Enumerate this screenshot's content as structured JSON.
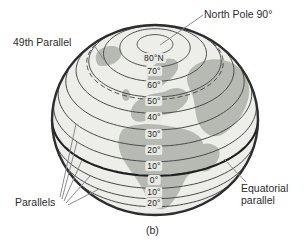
{
  "figure": {
    "caption": "(b)"
  },
  "colors": {
    "background": "#ffffff",
    "ocean": "#edeeea",
    "land": "#b7bab3",
    "outline": "#2e2e2e",
    "parallel": "#4a4a4a",
    "equator": "#1f1f1f",
    "leader": "#8a8a8a",
    "text": "#2b2b2b",
    "label_bg": "#e8e9e5"
  },
  "globe": {
    "center_x": 155,
    "center_y": 120,
    "radius_x": 103,
    "radius_y": 95,
    "view_latitude_deg": 36,
    "parallels": [
      {
        "lat": 80,
        "label": "80°N"
      },
      {
        "lat": 70,
        "label": "70°"
      },
      {
        "lat": 60,
        "label": "60°"
      },
      {
        "lat": 50,
        "label": "50°"
      },
      {
        "lat": 48.5,
        "label": "",
        "style": "dashed"
      },
      {
        "lat": 40,
        "label": "40°"
      },
      {
        "lat": 30,
        "label": "30°"
      },
      {
        "lat": 20,
        "label": "20°"
      },
      {
        "lat": 10,
        "label": "10°"
      },
      {
        "lat": 0,
        "label": "0°",
        "style": "equator"
      },
      {
        "lat": -10,
        "label": "10°"
      },
      {
        "lat": -20,
        "label": "20°"
      },
      {
        "lat": -30,
        "label": ""
      }
    ]
  },
  "annotations": {
    "north_pole": {
      "text": "North Pole 90°"
    },
    "forty_ninth_parallel": {
      "text": "49th Parallel"
    },
    "parallels": {
      "text": "Parallels"
    },
    "equatorial_parallel": {
      "text": "Equatorial parallel"
    }
  }
}
